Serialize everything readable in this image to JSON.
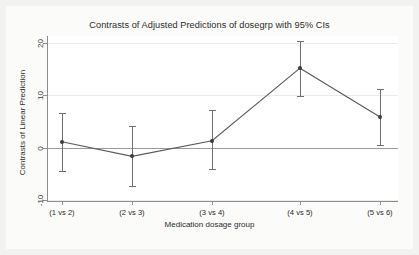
{
  "chart_data": {
    "type": "line",
    "title": "Contrasts of Adjusted Predictions of dosegrp with 95% CIs",
    "xlabel": "Medication dosage group",
    "ylabel": "Contrasts of Linear Prediction",
    "categories": [
      "(1 vs 2)",
      "(2 vs 3)",
      "(3 vs 4)",
      "(4 vs 5)",
      "(5 vs 6)"
    ],
    "values": [
      1.2,
      -1.6,
      1.4,
      15.2,
      5.9
    ],
    "ci_lower": [
      -4.3,
      -7.2,
      -4.0,
      9.9,
      0.6
    ],
    "ci_upper": [
      6.7,
      4.1,
      7.2,
      20.4,
      11.3
    ],
    "ytick_labels": [
      "20",
      "10",
      "0",
      "-10"
    ],
    "ytick_values": [
      20,
      10,
      0,
      -10
    ],
    "ylim": [
      -11.5,
      21.5
    ],
    "grid": true,
    "legend": "none",
    "reference_line": 0,
    "marker_color": "#3c3c3c",
    "line_color": "#5a5a5a",
    "ci_color": "#6f6f6f",
    "plot_background": "#ffffff",
    "figure_background": "#f2f2f0"
  }
}
